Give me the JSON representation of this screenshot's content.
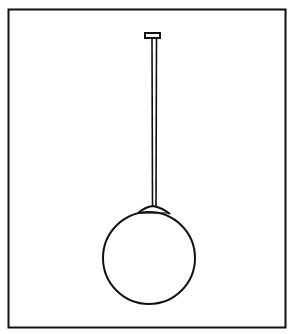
{
  "illustration": {
    "subject": "pendant-globe-lamp",
    "colors": {
      "stroke": "#111111",
      "background": "#ffffff"
    }
  }
}
